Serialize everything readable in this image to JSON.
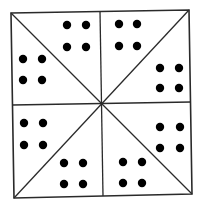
{
  "diagram": {
    "colors": {
      "line": "#2a2a2a",
      "dot": "#000000",
      "background": "#ffffff"
    },
    "square": {
      "tl": [
        11,
        13
      ],
      "tr": [
        189,
        10
      ],
      "br": [
        192,
        194
      ],
      "bl": [
        14,
        198
      ]
    },
    "center": [
      101,
      104
    ],
    "midpoints": {
      "top": [
        100,
        11
      ],
      "bottom": [
        103,
        196
      ],
      "left": [
        12,
        105
      ],
      "right": [
        191,
        102
      ]
    },
    "dot_radius": 4.2,
    "triangles": [
      {
        "name": "top-left-upper",
        "dot_count": 4,
        "dots": [
          [
            67,
            25
          ],
          [
            86,
            25
          ],
          [
            67,
            47
          ],
          [
            86,
            47
          ]
        ]
      },
      {
        "name": "top-left-lower",
        "dot_count": 4,
        "dots": [
          [
            23,
            59
          ],
          [
            42,
            59
          ],
          [
            23,
            80
          ],
          [
            42,
            80
          ]
        ]
      },
      {
        "name": "top-right-upper",
        "dot_count": 4,
        "dots": [
          [
            119,
            24
          ],
          [
            137,
            24
          ],
          [
            119,
            46
          ],
          [
            137,
            46
          ]
        ]
      },
      {
        "name": "top-right-lower",
        "dot_count": 4,
        "dots": [
          [
            160,
            68
          ],
          [
            179,
            68
          ],
          [
            160,
            88
          ],
          [
            179,
            88
          ]
        ]
      },
      {
        "name": "bottom-left-upper",
        "dot_count": 4,
        "dots": [
          [
            24,
            123
          ],
          [
            43,
            123
          ],
          [
            24,
            145
          ],
          [
            43,
            145
          ]
        ]
      },
      {
        "name": "bottom-left-lower",
        "dot_count": 4,
        "dots": [
          [
            64,
            163
          ],
          [
            83,
            163
          ],
          [
            64,
            184
          ],
          [
            83,
            184
          ]
        ]
      },
      {
        "name": "bottom-right-upper",
        "dot_count": 4,
        "dots": [
          [
            160,
            127
          ],
          [
            180,
            127
          ],
          [
            160,
            148
          ],
          [
            180,
            148
          ]
        ]
      },
      {
        "name": "bottom-right-lower",
        "dot_count": 4,
        "dots": [
          [
            123,
            162
          ],
          [
            142,
            162
          ],
          [
            123,
            183
          ],
          [
            142,
            183
          ]
        ]
      }
    ]
  }
}
